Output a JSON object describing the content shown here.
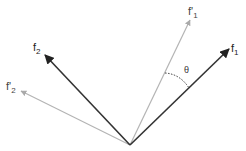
{
  "diagram": {
    "title": "",
    "origin": [
      130,
      145
    ],
    "vectors": [
      {
        "id": "f1",
        "label": "f",
        "sub": "1",
        "prime": false,
        "tip": [
          229,
          49
        ],
        "color": "#333333",
        "label_pos": [
          231,
          52
        ]
      },
      {
        "id": "f2",
        "label": "f",
        "sub": "2",
        "prime": false,
        "tip": [
          45,
          55
        ],
        "color": "#333333",
        "label_pos": [
          33,
          51
        ]
      },
      {
        "id": "f1p",
        "label": "f'",
        "sub": "1",
        "prime": true,
        "tip": [
          190,
          20
        ],
        "color": "#aaaaaa",
        "label_pos": [
          188,
          15
        ]
      },
      {
        "id": "f2p",
        "label": "f'",
        "sub": "2",
        "prime": true,
        "tip": [
          21,
          91
        ],
        "color": "#aaaaaa",
        "label_pos": [
          6,
          90
        ]
      }
    ],
    "angle": {
      "label": "θ",
      "between": [
        "f1p",
        "f1"
      ],
      "label_pos": [
        185,
        73
      ]
    }
  }
}
